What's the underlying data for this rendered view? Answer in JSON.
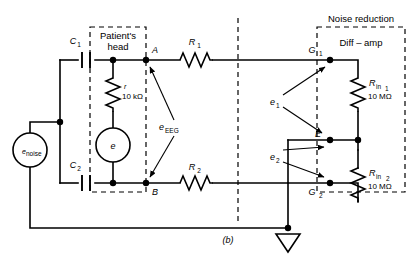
{
  "figure": {
    "caption": "(b)",
    "type": "circuit-diagram"
  },
  "boxes": {
    "patient_head": {
      "line1": "Patient's",
      "line2": "head"
    },
    "noise_reduction": {
      "title": "Noise reduction",
      "inner_label": "Diff – amp"
    }
  },
  "components": {
    "c1": {
      "label": "C",
      "sub": "1"
    },
    "c2": {
      "label": "C",
      "sub": "2"
    },
    "r_head": {
      "label": "r",
      "value": "10 kΩ"
    },
    "r1": {
      "label": "R",
      "sub": "1"
    },
    "r2": {
      "label": "R",
      "sub": "2"
    },
    "rin1": {
      "label": "R",
      "sub": "in",
      "sub2": "1",
      "value": "10 MΩ"
    },
    "rin2": {
      "label": "R",
      "sub": "in",
      "sub2": "2",
      "value": "10 MΩ"
    },
    "e_source": {
      "label": "e"
    },
    "e_noise": {
      "label": "e",
      "sub": "noise"
    }
  },
  "nodes": {
    "a": "A",
    "b": "B",
    "e": "E",
    "g1": {
      "label": "G",
      "sub": "1"
    },
    "g2": {
      "label": "G",
      "sub": "2"
    }
  },
  "signals": {
    "e_eeg": {
      "label": "e",
      "sub": "EEG"
    },
    "e1": {
      "label": "e",
      "sub": "1"
    },
    "e2": {
      "label": "e",
      "sub": "2"
    }
  },
  "colors": {
    "line": "#000000",
    "background": "#ffffff"
  }
}
